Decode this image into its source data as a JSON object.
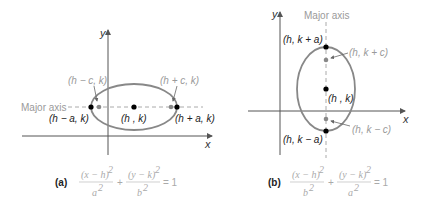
{
  "colors": {
    "axis": "#555555",
    "ellipse": "#888888",
    "dashed": "#aaaaaa",
    "vertex_point": "#000000",
    "focus_point": "#888888",
    "equation_text": "#aaaaaa"
  },
  "panel_a": {
    "caption": "(a)",
    "x_axis_label": "x",
    "y_axis_label": "y",
    "major_axis_label": "Major axis",
    "points": {
      "left_vertex": "(h − a, k)",
      "right_vertex": "(h + a, k)",
      "center": "(h , k)",
      "left_focus": "(h − c, k)",
      "right_focus": "(h + c, k)"
    },
    "equation": {
      "term1_num": "(x − h)",
      "term1_den": "a",
      "term2_num": "(y − k)",
      "term2_den": "b",
      "exp": "2",
      "plus": "+",
      "rhs": "= 1"
    }
  },
  "panel_b": {
    "caption": "(b)",
    "x_axis_label": "x",
    "y_axis_label": "y",
    "major_axis_label": "Major axis",
    "points": {
      "top_vertex": "(h, k + a)",
      "bottom_vertex": "(h, k − a)",
      "center": "(h , k)",
      "top_focus": "(h, k + c)",
      "bottom_focus": "(h, k − c)"
    },
    "equation": {
      "term1_num": "(x − h)",
      "term1_den": "b",
      "term2_num": "(y − k)",
      "term2_den": "a",
      "exp": "2",
      "plus": "+",
      "rhs": "= 1"
    }
  }
}
